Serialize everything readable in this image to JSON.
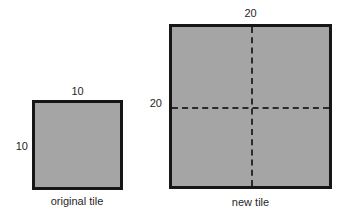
{
  "figure": {
    "type": "geometry-diagram",
    "background_color": "#ffffff",
    "tile_fill_color": "#a5a5a5",
    "tile_border_color": "#161616",
    "dashed_line_color": "#2b2b2b",
    "original_tile": {
      "caption": "original tile",
      "top_dimension_label": "10",
      "left_dimension_label": "10",
      "side_length": 10
    },
    "new_tile": {
      "caption": "new tile",
      "top_dimension_label": "20",
      "left_dimension_label": "20",
      "side_length": 20,
      "divided_into_quadrants": true
    }
  }
}
